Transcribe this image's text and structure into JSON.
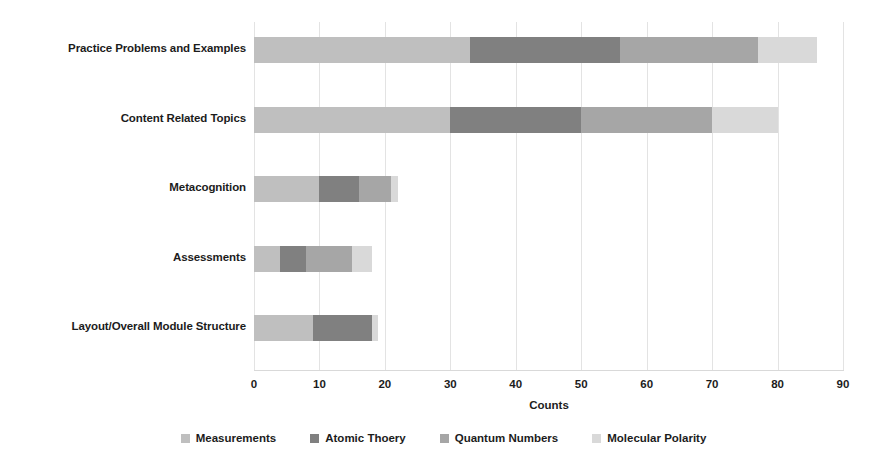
{
  "chart_data": {
    "type": "bar",
    "orientation": "horizontal",
    "stacked": true,
    "title": "",
    "xlabel": "Counts",
    "ylabel": "",
    "xlim": [
      0,
      90
    ],
    "xticks": [
      0,
      10,
      20,
      30,
      40,
      50,
      60,
      70,
      80,
      90
    ],
    "grid": true,
    "grid_axis": "x",
    "legend_position": "bottom",
    "categories": [
      "Practice Problems and Examples",
      "Content Related Topics",
      "Metacognition",
      "Assessments",
      "Layout/Overall Module Structure"
    ],
    "series": [
      {
        "name": "Measurements",
        "color": "#bfbfbf",
        "values": [
          33,
          30,
          10,
          4,
          9
        ]
      },
      {
        "name": "Atomic Thoery",
        "color": "#808080",
        "values": [
          23,
          20,
          6,
          4,
          9
        ]
      },
      {
        "name": "Quantum Numbers",
        "color": "#a6a6a6",
        "values": [
          21,
          20,
          5,
          7,
          0
        ]
      },
      {
        "name": "Molecular Polarity",
        "color": "#d9d9d9",
        "values": [
          9,
          10,
          1,
          3,
          1
        ]
      }
    ],
    "totals": [
      86,
      80,
      22,
      18,
      19
    ]
  },
  "axis": {
    "x_title": "Counts",
    "tick_labels": [
      "0",
      "10",
      "20",
      "30",
      "40",
      "50",
      "60",
      "70",
      "80",
      "90"
    ]
  },
  "legend": {
    "items": [
      {
        "label": "Measurements",
        "color": "#bfbfbf"
      },
      {
        "label": "Atomic Thoery",
        "color": "#808080"
      },
      {
        "label": "Quantum Numbers",
        "color": "#a6a6a6"
      },
      {
        "label": "Molecular Polarity",
        "color": "#d9d9d9"
      }
    ]
  },
  "colors": {
    "background": "#ffffff",
    "gridline": "#e3e3e3",
    "text": "#1c1c1c"
  }
}
